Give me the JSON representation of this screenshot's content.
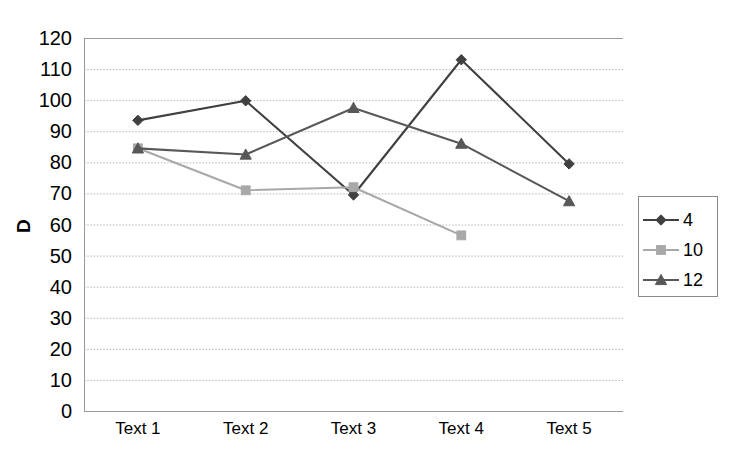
{
  "chart_data": {
    "type": "line",
    "title": "",
    "subtitle": "",
    "xlabel": "",
    "ylabel": "D",
    "categories": [
      "Text 1",
      "Text 2",
      "Text 3",
      "Text 4",
      "Text 5"
    ],
    "ylim": [
      0,
      120
    ],
    "ytick_step": 10,
    "yticks": [
      "0",
      "10",
      "20",
      "30",
      "40",
      "50",
      "60",
      "70",
      "80",
      "90",
      "100",
      "110",
      "120"
    ],
    "grid": "horizontal-dotted",
    "legend_position": "right",
    "series": [
      {
        "name": "4",
        "marker": "diamond",
        "color": "#404040",
        "values": [
          93.5,
          99.8,
          69.5,
          113.0,
          79.5
        ]
      },
      {
        "name": "10",
        "marker": "square",
        "color": "#a8a8a8",
        "values": [
          84.5,
          71.0,
          72.0,
          56.5,
          null
        ]
      },
      {
        "name": "12",
        "marker": "triangle",
        "color": "#585858",
        "values": [
          84.5,
          82.5,
          97.5,
          86.0,
          67.5
        ]
      }
    ]
  },
  "axis": {
    "y_title": "D"
  },
  "legend": {
    "entries": [
      {
        "label": "4"
      },
      {
        "label": "10"
      },
      {
        "label": "12"
      }
    ]
  }
}
